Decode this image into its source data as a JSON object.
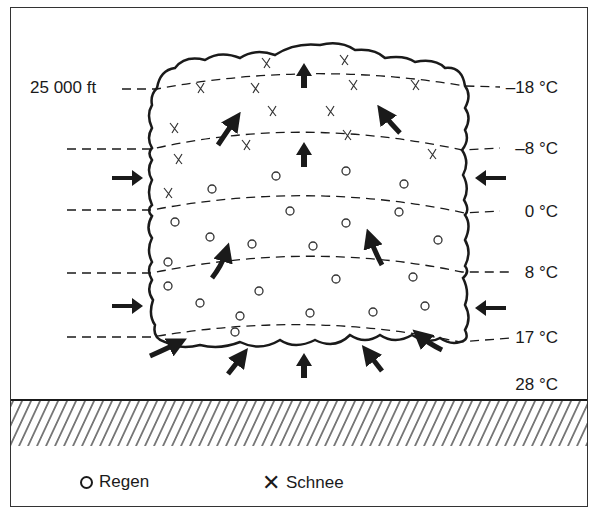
{
  "diagram": {
    "altitude_label": "25 000 ft",
    "temperature_levels": [
      {
        "label": "–18 °C",
        "y": 87
      },
      {
        "label": "–8 °C",
        "y": 148
      },
      {
        "label": "0 °C",
        "y": 211
      },
      {
        "label": "8 °C",
        "y": 272
      },
      {
        "label": "17 °C",
        "y": 337
      },
      {
        "label": "28 °C",
        "y": 384
      }
    ],
    "legend": {
      "rain_symbol": "circle",
      "rain_label": "Regen",
      "snow_symbol": "cross",
      "snow_label": "Schnee"
    },
    "colors": {
      "ink": "#1a1a1a",
      "background": "#ffffff"
    }
  }
}
